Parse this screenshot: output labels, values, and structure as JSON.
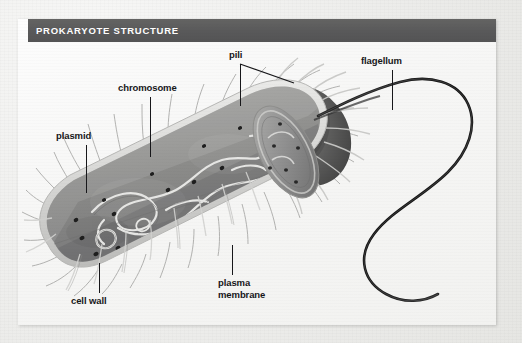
{
  "figure": {
    "title": "PROKARYOTE STRUCTURE",
    "title_bar_color": "#59595a",
    "title_text_color": "#ffffff",
    "panel_background": "#f7f7f5",
    "page_background": "#ececea",
    "labels": [
      {
        "id": "plasmid",
        "text": "plasmid",
        "x": 56,
        "y": 133
      },
      {
        "id": "chromosome",
        "text": "chromosome",
        "x": 118,
        "y": 85
      },
      {
        "id": "pili",
        "text": "pili",
        "x": 229,
        "y": 52
      },
      {
        "id": "flagellum",
        "text": "flagellum",
        "x": 361,
        "y": 58
      },
      {
        "id": "cell-wall",
        "text": "cell wall",
        "x": 71,
        "y": 298
      },
      {
        "id": "plasma-membrane",
        "text": "plasma membrane",
        "x": 218,
        "y": 280
      }
    ],
    "structures": [
      {
        "id": "cell-body",
        "name": "bacterium body",
        "color": "#8e8e8e"
      },
      {
        "id": "cell-wall-layer",
        "name": "cell wall",
        "color": "#d8d8d6"
      },
      {
        "id": "cut-cap",
        "name": "cut-away end cap",
        "color": "#5c5c5c"
      },
      {
        "id": "chromosome-dna",
        "name": "chromosome strand",
        "color": "#e4e4e2"
      },
      {
        "id": "plasmid-loop",
        "name": "plasmid loop",
        "color": "#e4e4e2"
      },
      {
        "id": "ribosome-dots",
        "name": "ribosomes",
        "color": "#232323"
      },
      {
        "id": "pili-fibers",
        "name": "pili",
        "color": "#b8b8b6"
      },
      {
        "id": "flagellum-whip",
        "name": "flagellum",
        "color": "#1a1a1a"
      }
    ]
  }
}
